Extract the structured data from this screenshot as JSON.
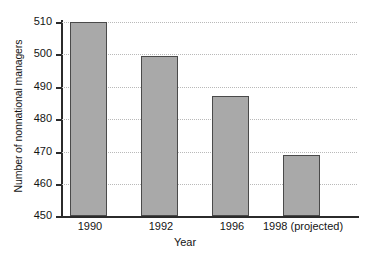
{
  "chart_data": {
    "type": "bar",
    "title": "",
    "xlabel": "Year",
    "ylabel": "Number of nonnational managers",
    "categories": [
      "1990",
      "1992",
      "1996",
      "1998 (projected)"
    ],
    "values": [
      510,
      499.5,
      487,
      469
    ],
    "ylim": [
      450,
      510
    ],
    "yticks": [
      450,
      460,
      470,
      480,
      490,
      500,
      510
    ],
    "ytick_labels": [
      "450",
      "460",
      "470",
      "480",
      "490",
      "500",
      "510"
    ],
    "grid": "horizontal-dotted",
    "legend": "none",
    "bar_color": "#a9a9a9",
    "bar_edge_color": "#4a4a4a",
    "axis_color": "#2b2b2b",
    "grid_color": "#b9b9b9",
    "background": "#ffffff",
    "series": [
      {
        "name": "Number of nonnational managers",
        "values": [
          510,
          499.5,
          487,
          469
        ]
      }
    ]
  }
}
